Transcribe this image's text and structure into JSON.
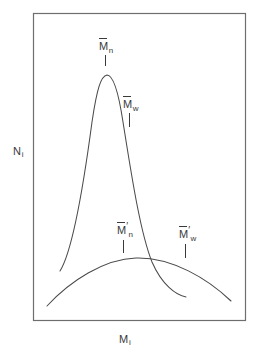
{
  "figure": {
    "line_color": "#4a4a4a",
    "frame_color": "#6e6e6e",
    "text_color": "#3a3a3a",
    "background": "#ffffff"
  },
  "axes": {
    "y": {
      "symbol": "N",
      "subscript": "i"
    },
    "x": {
      "symbol": "M",
      "subscript": "i"
    }
  },
  "markers": [
    {
      "id": "mn",
      "symbol": "M",
      "overbar": true,
      "prime": "",
      "subscript": "n",
      "label": "M̅n"
    },
    {
      "id": "mw",
      "symbol": "M",
      "overbar": true,
      "prime": "",
      "subscript": "w",
      "label": "M̅w"
    },
    {
      "id": "mn-prime",
      "symbol": "M",
      "overbar": true,
      "prime": "′",
      "subscript": "n",
      "label": "M̅′n"
    },
    {
      "id": "mw-prime",
      "symbol": "M",
      "overbar": true,
      "prime": "′",
      "subscript": "w",
      "label": "M̅′w"
    }
  ],
  "chart_data": {
    "type": "line",
    "title": "",
    "xlabel": "M_i",
    "ylabel": "N_i",
    "grid": false,
    "legend": "none",
    "xlim": [
      0,
      1
    ],
    "ylim": [
      0,
      1
    ],
    "annotations": [
      {
        "text": "M̅n",
        "x_px": 107,
        "y_px": 44,
        "tick_from_px": [
          106,
          56
        ],
        "tick_to_px": [
          106,
          67
        ],
        "describes": "number-average molecular weight of narrow distribution"
      },
      {
        "text": "M̅w",
        "x_px": 131,
        "y_px": 102,
        "tick_from_px": [
          130,
          114
        ],
        "tick_to_px": [
          130,
          128
        ],
        "describes": "weight-average molecular weight of narrow distribution"
      },
      {
        "text": "M̅′n",
        "x_px": 125,
        "y_px": 228,
        "tick_from_px": [
          124,
          241
        ],
        "tick_to_px": [
          124,
          254
        ],
        "describes": "number-average molecular weight of broad distribution"
      },
      {
        "text": "M̅′w",
        "x_px": 187,
        "y_px": 232,
        "tick_from_px": [
          186,
          245
        ],
        "tick_to_px": [
          186,
          259
        ],
        "describes": "weight-average molecular weight of broad distribution"
      }
    ],
    "series": [
      {
        "name": "narrow distribution",
        "description": "tall sharp peak, rounded apex, long tails",
        "peak_px": [
          107,
          75
        ],
        "left_tail_end_px": [
          60,
          271
        ],
        "right_tail_end_px": [
          186,
          297
        ],
        "path": "M 60,271 C 72,252 84,182 92,122 C 97,88 101,76 107,75 C 113,75 118,89 123,122 C 131,172 140,232 152,262 C 162,285 176,295 186,297"
      },
      {
        "name": "broad distribution",
        "description": "low wide flat hump spanning the whole frame",
        "peak_px": [
          136,
          258
        ],
        "left_end_px": [
          47,
          306
        ],
        "right_end_px": [
          231,
          301
        ],
        "path": "M 47,306 C 70,281 104,259 136,258 C 172,257 208,279 231,301"
      }
    ],
    "frame_px": {
      "x": 33,
      "y": 13,
      "width": 212,
      "height": 307
    }
  }
}
